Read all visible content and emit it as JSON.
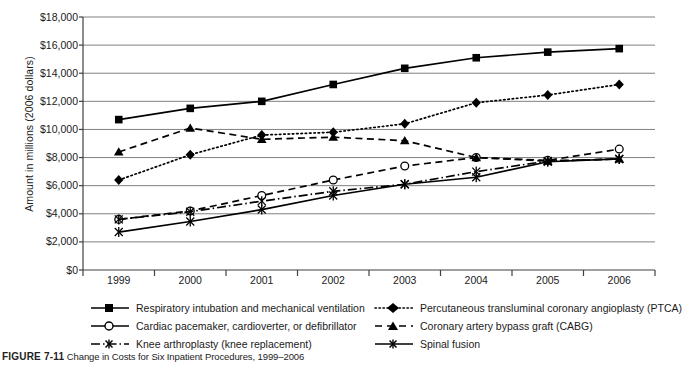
{
  "figure": {
    "caption_prefix": "FIGURE 7-11",
    "caption_text": "Change in Costs for Six Inpatient Procedures, 1999–2006"
  },
  "chart_data": {
    "type": "line",
    "title": "",
    "xlabel": "",
    "ylabel": "Amount in millions (2006 dollars)",
    "categories": [
      "1999",
      "2000",
      "2001",
      "2002",
      "2003",
      "2004",
      "2005",
      "2006"
    ],
    "ylim": [
      0,
      18000
    ],
    "ytick_labels": [
      "$18,000",
      "$16,000",
      "$14,000",
      "$12,000",
      "$10,000",
      "$8,000",
      "$6,000",
      "$4,000",
      "$2,000",
      "$0"
    ],
    "ytick_values": [
      18000,
      16000,
      14000,
      12000,
      10000,
      8000,
      6000,
      4000,
      2000,
      0
    ],
    "grid": true,
    "legend_position": "below",
    "series": [
      {
        "name": "Respiratory intubation and mechanical ventilation",
        "marker": "square",
        "dash": "solid",
        "color": "#000000",
        "values": [
          10700,
          11500,
          12000,
          13200,
          14350,
          15100,
          15500,
          15750
        ]
      },
      {
        "name": "Percutaneous transluminal coronary angioplasty (PTCA)",
        "marker": "diamond",
        "dash": "dotted",
        "color": "#000000",
        "values": [
          6400,
          8200,
          9600,
          9800,
          10400,
          11900,
          12450,
          13200
        ]
      },
      {
        "name": "Cardiac pacemaker, cardioverter, or defibrillator",
        "marker": "circle",
        "dash": "dashed",
        "color": "#000000",
        "values": [
          3600,
          4200,
          5300,
          6400,
          7400,
          8000,
          7800,
          8600
        ]
      },
      {
        "name": "Coronary artery bypass graft (CABG)",
        "marker": "triangle",
        "dash": "dashed",
        "color": "#000000",
        "values": [
          8400,
          10100,
          9300,
          9450,
          9200,
          8000,
          7750,
          7900
        ]
      },
      {
        "name": "Knee arthroplasty (knee replacement)",
        "marker": "asterisk",
        "dash": "dashdot",
        "color": "#000000",
        "values": [
          3600,
          4150,
          4900,
          5600,
          6100,
          7000,
          7750,
          7900
        ]
      },
      {
        "name": "Spinal fusion",
        "marker": "asterisk",
        "dash": "solid",
        "color": "#000000",
        "values": [
          2700,
          3450,
          4300,
          5300,
          6100,
          6600,
          7700,
          7900
        ]
      }
    ]
  },
  "legend": {
    "items": [
      {
        "label": "Respiratory intubation and mechanical ventilation",
        "key": "solid-square"
      },
      {
        "label": "Percutaneous transluminal coronary angioplasty (PTCA)",
        "key": "dotted-diamond"
      },
      {
        "label": "Cardiac pacemaker, cardioverter, or defibrillator",
        "key": "solid-circle-open"
      },
      {
        "label": "Coronary artery bypass graft (CABG)",
        "key": "dashed-triangle"
      },
      {
        "label": "Knee arthroplasty (knee replacement)",
        "key": "dashdot-asterisk"
      },
      {
        "label": "Spinal fusion",
        "key": "solid-asterisk"
      }
    ]
  }
}
